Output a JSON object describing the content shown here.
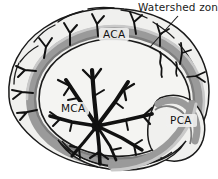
{
  "figure": {
    "width": 218,
    "height": 179,
    "background_color": "#ffffff"
  },
  "callouts": [
    {
      "id": "watershed",
      "label": "Watershed zone",
      "text_x": 138,
      "text_y": 11,
      "leader_line": {
        "x1": 178,
        "y1": 16,
        "x2": 150,
        "y2": 47
      }
    }
  ],
  "territory_labels": [
    {
      "id": "aca",
      "label": "ACA",
      "x": 103,
      "y": 38,
      "artery": "anterior cerebral artery"
    },
    {
      "id": "mca",
      "label": "MCA",
      "x": 61,
      "y": 112,
      "artery": "middle cerebral artery"
    },
    {
      "id": "pca",
      "label": "PCA",
      "x": 170,
      "y": 124,
      "artery": "posterior cerebral artery"
    }
  ],
  "colors": {
    "outline": "#1a1a1a",
    "vessel": "#111111",
    "cortex_fill": "#f0f0ee",
    "inner_fill": "#f4f4f2",
    "watershed_band": "#9a9a9a",
    "band_shadow": "#7d7d7d",
    "band_light": "#c9c9c9",
    "text": "#1a1a1a",
    "background": "#ffffff"
  },
  "structures": [
    {
      "id": "cortex-outer",
      "name": "outer cortical mantle"
    },
    {
      "id": "watershed-band",
      "name": "watershed zone gray band"
    },
    {
      "id": "inner-territory",
      "name": "inner MCA territory"
    },
    {
      "id": "pca-lobe",
      "name": "occipital PCA lobe"
    },
    {
      "id": "temporal-lobe",
      "name": "temporal lobe"
    },
    {
      "id": "mca-tree",
      "name": "middle cerebral artery branching tree"
    },
    {
      "id": "cortical-branches",
      "name": "peripheral cortical branches"
    }
  ]
}
